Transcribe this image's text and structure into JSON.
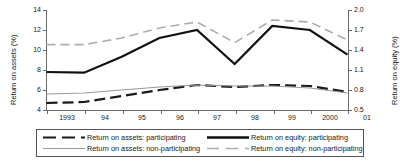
{
  "chart_data": {
    "type": "line",
    "title": "",
    "x": [
      "1993",
      "94",
      "95",
      "96",
      "97",
      "98",
      "99",
      "2000",
      "01"
    ],
    "xlabel": "",
    "ylabel": "Return on assets (%)",
    "y2label": "Return on equity (%)",
    "ylim": [
      4,
      14
    ],
    "yticks": [
      "4",
      "6",
      "8",
      "10",
      "12",
      "14"
    ],
    "y2lim": [
      0.5,
      2.0
    ],
    "y2ticks": [
      "0.5",
      "0.8",
      "1.1",
      "1.4",
      "1.7",
      "2.0"
    ],
    "grid": false,
    "legend_position": "bottom",
    "series": [
      {
        "name": "Return on assets: participating",
        "axis": "left",
        "style": "dashed",
        "color": "#1a1a1a",
        "width": 2.2,
        "values": [
          4.7,
          4.8,
          5.4,
          6.0,
          6.5,
          6.3,
          6.5,
          6.4,
          5.8
        ]
      },
      {
        "name": "Return on assets: non-participating",
        "axis": "left",
        "style": "solid",
        "color": "#9a9a9a",
        "width": 1.2,
        "values": [
          5.6,
          5.7,
          6.0,
          6.3,
          6.5,
          6.4,
          6.4,
          6.2,
          5.7
        ]
      },
      {
        "name": "Return on equity: participating",
        "axis": "right",
        "style": "solid",
        "color": "#111111",
        "width": 2.2,
        "values": [
          1.07,
          1.06,
          1.3,
          1.58,
          1.7,
          1.19,
          1.76,
          1.7,
          1.33
        ]
      },
      {
        "name": "Return on equity: non-participating",
        "axis": "right",
        "style": "dashed",
        "color": "#adadad",
        "width": 1.6,
        "values": [
          1.48,
          1.48,
          1.58,
          1.73,
          1.82,
          1.51,
          1.85,
          1.82,
          1.55
        ]
      }
    ]
  },
  "axes": {
    "left_title": "Return on assets (%)",
    "right_title": "Return on equity (%)",
    "y_left_ticks": [
      "14",
      "12",
      "10",
      "8",
      "6",
      "4"
    ],
    "y_right_ticks": [
      "2.0",
      "1.7",
      "1.4",
      "1.1",
      "0.8",
      "0.5"
    ],
    "x_ticks": [
      "1993",
      "94",
      "95",
      "96",
      "97",
      "98",
      "99",
      "2000",
      "01"
    ]
  },
  "legend": {
    "entries": [
      {
        "label": "Return on assets: participating",
        "key": "black-dashed-line-key"
      },
      {
        "label": "Return on assets: non-participating",
        "key": "grey-solid-line-key"
      },
      {
        "label": "Return on equity: participating",
        "key": "black-solid-line-key"
      },
      {
        "label": "Return on equity: non-participating",
        "key": "grey-dashed-line-key"
      }
    ]
  },
  "colors": {
    "axis": "#6b6b6b",
    "series_dark": "#1a1a1a",
    "series_light": "#9a9a9a",
    "background": "#ffffff"
  }
}
